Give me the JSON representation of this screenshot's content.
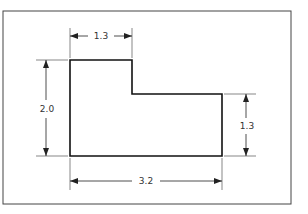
{
  "drawing": {
    "title": "L-shaped part with dimensions",
    "dimensions": {
      "top_width": "1.3",
      "left_height": "2.0",
      "right_height": "1.3",
      "bottom_width": "3.2"
    }
  }
}
